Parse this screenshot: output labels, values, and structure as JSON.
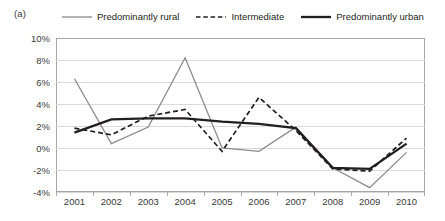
{
  "panel": {
    "label": "(a)"
  },
  "legend": {
    "position": "top",
    "entries": [
      {
        "name": "rural-legend",
        "label": "Predominantly rural",
        "style": "solid",
        "color": "#8c8c8c",
        "width": 1.3
      },
      {
        "name": "intermediate-legend",
        "label": "Intermediate",
        "style": "dashed",
        "color": "#231f20",
        "width": 1.7
      },
      {
        "name": "urban-legend",
        "label": "Predominantly urban",
        "style": "solid",
        "color": "#231f20",
        "width": 2.3
      }
    ]
  },
  "chart_data": {
    "type": "line",
    "title": "",
    "subtitle": "",
    "xlabel": "",
    "ylabel": "",
    "x": [
      2001,
      2002,
      2003,
      2004,
      2005,
      2006,
      2007,
      2008,
      2009,
      2010
    ],
    "categories": [
      "2001",
      "2002",
      "2003",
      "2004",
      "2005",
      "2006",
      "2007",
      "2008",
      "2009",
      "2010"
    ],
    "ylim": [
      -4,
      10
    ],
    "yticks": [
      -4,
      -2,
      0,
      2,
      4,
      6,
      8,
      10
    ],
    "ytick_labels": [
      "-4%",
      "-2%",
      "0%",
      "2%",
      "4%",
      "6%",
      "8%",
      "10%"
    ],
    "grid": "horizontal",
    "legend_position": "top",
    "series": [
      {
        "name": "Predominantly rural",
        "color": "#8c8c8c",
        "style": "solid",
        "width": 1.3,
        "values": [
          6.3,
          0.4,
          1.9,
          8.2,
          0.0,
          -0.3,
          1.9,
          -1.8,
          -3.6,
          -0.4
        ]
      },
      {
        "name": "Intermediate",
        "color": "#231f20",
        "style": "dashed",
        "width": 1.7,
        "values": [
          1.8,
          1.2,
          2.9,
          3.5,
          -0.3,
          4.6,
          1.6,
          -1.9,
          -2.1,
          0.9
        ]
      },
      {
        "name": "Predominantly urban",
        "color": "#231f20",
        "style": "solid",
        "width": 2.3,
        "values": [
          1.4,
          2.6,
          2.7,
          2.7,
          2.4,
          2.2,
          1.8,
          -1.8,
          -1.9,
          0.4
        ]
      }
    ]
  }
}
